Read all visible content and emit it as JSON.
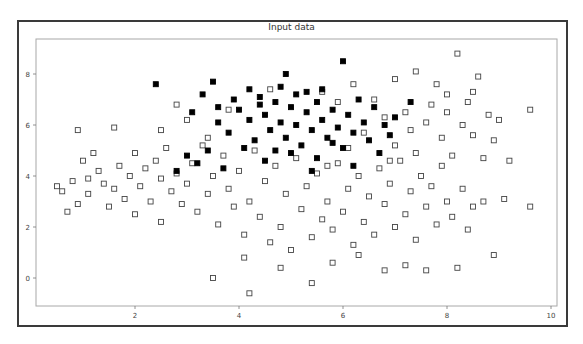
{
  "chart_data": {
    "type": "scatter",
    "title": "Input data",
    "xlabel": "",
    "ylabel": "",
    "xlim": [
      0.1,
      10.15
    ],
    "ylim": [
      -1.1,
      9.35
    ],
    "xticks": [
      2,
      4,
      6,
      8,
      10
    ],
    "yticks": [
      0,
      2,
      4,
      6,
      8
    ],
    "grid": false,
    "legend": null,
    "series": [
      {
        "name": "class-outline",
        "marker": "square-open",
        "color": "#444444",
        "points": [
          [
            0.5,
            3.6
          ],
          [
            0.6,
            3.4
          ],
          [
            0.7,
            2.6
          ],
          [
            0.9,
            2.9
          ],
          [
            0.8,
            3.8
          ],
          [
            1.0,
            4.6
          ],
          [
            1.1,
            3.9
          ],
          [
            1.2,
            4.9
          ],
          [
            0.9,
            5.8
          ],
          [
            1.1,
            3.3
          ],
          [
            1.3,
            4.2
          ],
          [
            1.4,
            3.7
          ],
          [
            1.5,
            2.8
          ],
          [
            1.6,
            3.5
          ],
          [
            1.7,
            4.4
          ],
          [
            1.6,
            5.9
          ],
          [
            1.8,
            3.1
          ],
          [
            1.9,
            4.0
          ],
          [
            2.0,
            2.5
          ],
          [
            2.1,
            3.6
          ],
          [
            2.2,
            4.3
          ],
          [
            2.0,
            4.9
          ],
          [
            2.3,
            3.0
          ],
          [
            2.4,
            4.6
          ],
          [
            2.5,
            3.9
          ],
          [
            2.6,
            5.1
          ],
          [
            2.5,
            2.2
          ],
          [
            2.7,
            3.4
          ],
          [
            2.8,
            4.1
          ],
          [
            2.9,
            2.9
          ],
          [
            3.0,
            3.7
          ],
          [
            3.1,
            4.5
          ],
          [
            3.2,
            2.6
          ],
          [
            3.3,
            5.2
          ],
          [
            3.4,
            3.3
          ],
          [
            3.5,
            4.0
          ],
          [
            3.6,
            2.1
          ],
          [
            3.7,
            4.8
          ],
          [
            3.8,
            3.5
          ],
          [
            3.9,
            2.8
          ],
          [
            4.0,
            4.2
          ],
          [
            4.1,
            1.7
          ],
          [
            4.2,
            3.0
          ],
          [
            4.3,
            5.0
          ],
          [
            4.4,
            2.4
          ],
          [
            4.5,
            3.8
          ],
          [
            4.6,
            1.4
          ],
          [
            4.7,
            4.4
          ],
          [
            4.8,
            2.0
          ],
          [
            4.9,
            3.3
          ],
          [
            5.0,
            1.1
          ],
          [
            5.1,
            4.7
          ],
          [
            5.2,
            2.7
          ],
          [
            5.3,
            3.6
          ],
          [
            5.4,
            1.6
          ],
          [
            5.5,
            4.1
          ],
          [
            5.6,
            2.3
          ],
          [
            5.7,
            3.0
          ],
          [
            5.8,
            1.9
          ],
          [
            5.9,
            4.5
          ],
          [
            6.0,
            2.6
          ],
          [
            6.1,
            3.5
          ],
          [
            6.2,
            1.3
          ],
          [
            6.3,
            4.0
          ],
          [
            6.4,
            2.2
          ],
          [
            6.5,
            3.2
          ],
          [
            6.6,
            1.7
          ],
          [
            6.7,
            4.3
          ],
          [
            6.8,
            2.9
          ],
          [
            6.9,
            3.7
          ],
          [
            7.0,
            2.0
          ],
          [
            7.1,
            4.6
          ],
          [
            7.2,
            2.5
          ],
          [
            7.3,
            3.4
          ],
          [
            7.4,
            1.5
          ],
          [
            7.5,
            4.0
          ],
          [
            7.6,
            2.8
          ],
          [
            7.7,
            3.6
          ],
          [
            7.8,
            2.1
          ],
          [
            7.9,
            4.4
          ],
          [
            8.0,
            3.0
          ],
          [
            8.1,
            2.4
          ],
          [
            8.2,
            0.4
          ],
          [
            8.3,
            3.5
          ],
          [
            8.4,
            1.9
          ],
          [
            8.5,
            2.8
          ],
          [
            8.7,
            3.0
          ],
          [
            8.9,
            0.9
          ],
          [
            9.1,
            3.1
          ],
          [
            9.6,
            2.8
          ],
          [
            3.5,
            0.0
          ],
          [
            4.2,
            -0.6
          ],
          [
            5.4,
            -0.2
          ],
          [
            4.8,
            0.4
          ],
          [
            6.8,
            0.3
          ],
          [
            7.6,
            0.3
          ],
          [
            5.8,
            0.6
          ],
          [
            4.1,
            0.8
          ],
          [
            6.3,
            0.9
          ],
          [
            7.2,
            0.5
          ],
          [
            2.5,
            5.8
          ],
          [
            3.0,
            6.2
          ],
          [
            2.8,
            6.8
          ],
          [
            3.4,
            5.5
          ],
          [
            3.8,
            6.6
          ],
          [
            4.6,
            7.4
          ],
          [
            6.2,
            7.6
          ],
          [
            6.6,
            7.0
          ],
          [
            7.0,
            7.8
          ],
          [
            7.4,
            8.1
          ],
          [
            7.8,
            7.6
          ],
          [
            8.2,
            8.8
          ],
          [
            8.0,
            7.2
          ],
          [
            8.4,
            6.9
          ],
          [
            8.6,
            7.9
          ],
          [
            8.8,
            6.4
          ],
          [
            9.0,
            6.2
          ],
          [
            9.6,
            6.6
          ],
          [
            8.5,
            5.6
          ],
          [
            8.9,
            5.4
          ],
          [
            7.2,
            6.5
          ],
          [
            7.6,
            6.1
          ],
          [
            7.9,
            5.5
          ],
          [
            8.3,
            6.0
          ],
          [
            7.0,
            5.2
          ],
          [
            6.8,
            6.3
          ],
          [
            7.4,
            4.9
          ],
          [
            8.1,
            4.8
          ],
          [
            8.7,
            4.7
          ],
          [
            9.2,
            4.6
          ],
          [
            6.4,
            5.7
          ],
          [
            5.9,
            6.9
          ],
          [
            5.6,
            7.3
          ],
          [
            6.9,
            4.6
          ],
          [
            7.3,
            5.8
          ],
          [
            7.7,
            6.8
          ],
          [
            8.0,
            6.5
          ],
          [
            8.5,
            7.3
          ],
          [
            6.1,
            5.1
          ],
          [
            5.7,
            4.4
          ]
        ]
      },
      {
        "name": "class-filled",
        "marker": "square-filled",
        "color": "#000000",
        "points": [
          [
            2.4,
            7.6
          ],
          [
            3.3,
            7.2
          ],
          [
            3.5,
            7.7
          ],
          [
            4.8,
            7.5
          ],
          [
            4.9,
            8.0
          ],
          [
            5.3,
            7.3
          ],
          [
            6.0,
            8.5
          ],
          [
            3.1,
            6.5
          ],
          [
            3.6,
            6.1
          ],
          [
            3.9,
            7.0
          ],
          [
            4.0,
            6.6
          ],
          [
            4.2,
            6.2
          ],
          [
            4.4,
            7.1
          ],
          [
            4.5,
            6.4
          ],
          [
            4.6,
            5.8
          ],
          [
            4.7,
            6.9
          ],
          [
            4.8,
            6.1
          ],
          [
            4.9,
            5.5
          ],
          [
            5.0,
            6.7
          ],
          [
            5.1,
            6.0
          ],
          [
            5.2,
            5.2
          ],
          [
            5.3,
            6.5
          ],
          [
            5.4,
            5.8
          ],
          [
            5.5,
            6.9
          ],
          [
            5.6,
            6.2
          ],
          [
            5.7,
            5.5
          ],
          [
            5.8,
            6.6
          ],
          [
            5.9,
            5.9
          ],
          [
            6.0,
            5.1
          ],
          [
            6.1,
            6.4
          ],
          [
            6.2,
            5.7
          ],
          [
            6.3,
            7.0
          ],
          [
            6.4,
            6.1
          ],
          [
            6.5,
            5.4
          ],
          [
            6.6,
            6.7
          ],
          [
            6.8,
            6.0
          ],
          [
            7.0,
            6.3
          ],
          [
            7.3,
            6.9
          ],
          [
            4.3,
            5.4
          ],
          [
            4.1,
            5.1
          ],
          [
            3.8,
            5.7
          ],
          [
            3.4,
            5.0
          ],
          [
            3.0,
            4.8
          ],
          [
            2.8,
            4.2
          ],
          [
            3.2,
            4.5
          ],
          [
            3.7,
            4.3
          ],
          [
            4.5,
            4.6
          ],
          [
            5.0,
            4.9
          ],
          [
            5.5,
            4.7
          ],
          [
            6.2,
            4.4
          ],
          [
            6.7,
            4.9
          ],
          [
            5.4,
            4.2
          ],
          [
            4.7,
            5.0
          ],
          [
            5.8,
            5.3
          ],
          [
            6.9,
            5.6
          ],
          [
            4.4,
            6.8
          ],
          [
            5.1,
            7.2
          ],
          [
            5.6,
            7.4
          ],
          [
            4.2,
            7.4
          ],
          [
            3.6,
            6.7
          ]
        ]
      }
    ]
  },
  "labels": {
    "title": "Input data",
    "xticks": [
      "2",
      "4",
      "6",
      "8",
      "10"
    ],
    "yticks": [
      "0",
      "2",
      "4",
      "6",
      "8"
    ]
  }
}
